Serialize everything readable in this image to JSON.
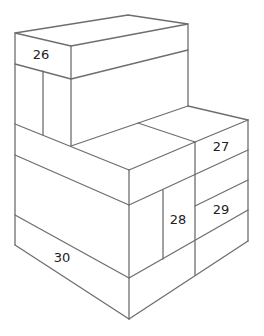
{
  "diagram": {
    "type": "isometric-block-stack",
    "stroke_color": "#6e6e6e",
    "background": "#ffffff",
    "labels": [
      {
        "id": "block-26",
        "text": "26"
      },
      {
        "id": "block-27",
        "text": "27"
      },
      {
        "id": "block-28",
        "text": "28"
      },
      {
        "id": "block-29",
        "text": "29"
      },
      {
        "id": "block-30",
        "text": "30"
      }
    ]
  }
}
